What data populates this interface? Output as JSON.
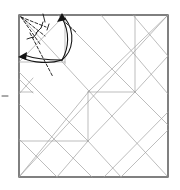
{
  "diagram": {
    "kind": "origami-crease-pattern-step",
    "background": "#ffffff",
    "canvas": {
      "width": 180,
      "height": 190
    },
    "paper": {
      "x": 19,
      "y": 15,
      "width": 149,
      "height": 162,
      "fill": "#ffffff",
      "border_color": "#2c2c2c",
      "border_width": 1.2
    },
    "creases": {
      "color": "#a0a0a0",
      "width": 0.7,
      "segments": [
        [
          65,
          15,
          65,
          64
        ],
        [
          19,
          62,
          65,
          62
        ],
        [
          65,
          15,
          19,
          62
        ],
        [
          19,
          15,
          168,
          177
        ],
        [
          168,
          15,
          19,
          177
        ],
        [
          135,
          15,
          135,
          92
        ],
        [
          88,
          92,
          135,
          92
        ],
        [
          88,
          92,
          88,
          141
        ],
        [
          19,
          141,
          88,
          141
        ],
        [
          58,
          15,
          135,
          92
        ],
        [
          135,
          92,
          88,
          141
        ],
        [
          88,
          141,
          19,
          72
        ],
        [
          135,
          92,
          168,
          125
        ],
        [
          88,
          141,
          121,
          177
        ],
        [
          168,
          15,
          88,
          92
        ],
        [
          19,
          104,
          92,
          177
        ],
        [
          19,
          177,
          90,
          90
        ],
        [
          104,
          177,
          168,
          112
        ],
        [
          57,
          177,
          88,
          141
        ],
        [
          57,
          177,
          19,
          139
        ],
        [
          135,
          92,
          168,
          56
        ],
        [
          133,
          15,
          168,
          56
        ],
        [
          101,
          15,
          168,
          94
        ],
        [
          121,
          177,
          168,
          130
        ],
        [
          19,
          92,
          33,
          92
        ],
        [
          19,
          79,
          33,
          93
        ],
        [
          33,
          78,
          19,
          94
        ]
      ]
    },
    "fold_annotations": {
      "color": "#141414",
      "dashed_lines": {
        "dash": "3 2",
        "width": 0.9,
        "segments": [
          [
            21,
            17,
            46,
            27
          ],
          [
            21,
            17,
            45,
            36
          ],
          [
            21,
            17,
            40,
            44
          ],
          [
            30,
            33,
            53,
            77
          ],
          [
            66,
            23,
            77,
            33
          ]
        ]
      },
      "tick_marks": {
        "width": 0.9,
        "segments": [
          [
            43,
            14,
            45,
            22
          ],
          [
            43,
            22,
            41,
            28
          ],
          [
            41,
            28,
            36,
            33
          ],
          [
            37,
            33,
            33,
            38
          ],
          [
            33,
            37,
            27,
            39
          ],
          [
            49,
            24,
            47,
            30
          ]
        ]
      },
      "arrows": [
        {
          "name": "fold-arrow-to-top-edge",
          "stroke_width": 1.1,
          "curves": [
            "M62,60 C73,51 76,33 65,18",
            "M62,60 C69,48 70,32 62,18"
          ],
          "head": "62,13 57,22 66,20"
        },
        {
          "name": "fold-arrow-to-left-edge",
          "stroke_width": 1.1,
          "curves": [
            "M62,60 C50,64 33,63 23,58",
            "M62,60 C49,60 35,59 24,55"
          ],
          "head": "18,57 27,52 26,60"
        }
      ]
    },
    "margin_tick": {
      "segment": [
        2,
        96,
        8,
        96
      ],
      "color": "#555555",
      "width": 1
    }
  }
}
